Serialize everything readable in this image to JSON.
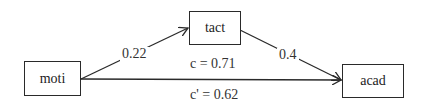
{
  "diagram": {
    "type": "mediation-path-diagram",
    "nodes": [
      {
        "id": "moti",
        "label": "moti",
        "role": "predictor"
      },
      {
        "id": "tact",
        "label": "tact",
        "role": "mediator"
      },
      {
        "id": "acad",
        "label": "acad",
        "role": "outcome"
      }
    ],
    "edges": [
      {
        "from": "moti",
        "to": "tact",
        "label": "0.22",
        "path": "a"
      },
      {
        "from": "tact",
        "to": "acad",
        "label": "0.4",
        "path": "b"
      },
      {
        "from": "moti",
        "to": "acad",
        "label_total": "c = 0.71",
        "label_direct": "c' = 0.62",
        "path": "c"
      }
    ],
    "colors": {
      "line": "#2a2a2a",
      "text": "#222222",
      "background": "#ffffff"
    }
  }
}
